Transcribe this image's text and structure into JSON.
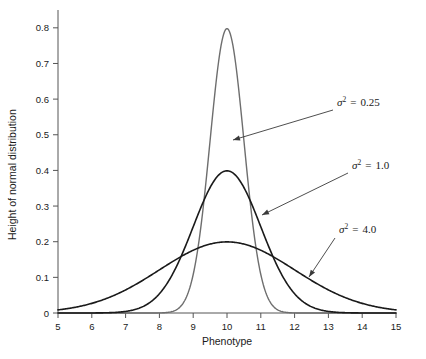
{
  "chart_data": {
    "type": "line",
    "title": "",
    "subtitle": "",
    "xlabel": "Phenotype",
    "ylabel": "Height of normal distribution",
    "xlim": [
      5,
      15
    ],
    "ylim": [
      0,
      0.85
    ],
    "grid": false,
    "legend_position": "inline-annotations",
    "x_ticks": [
      "5",
      "6",
      "7",
      "8",
      "9",
      "10",
      "11",
      "12",
      "13",
      "14",
      "15"
    ],
    "x_tick_values": [
      5,
      6,
      7,
      8,
      9,
      10,
      11,
      12,
      13,
      14,
      15
    ],
    "y_ticks": [
      "0",
      "0.1",
      "0.2",
      "0.3",
      "0.4",
      "0.5",
      "0.6",
      "0.7",
      "0.8"
    ],
    "y_tick_values": [
      0,
      0.1,
      0.2,
      0.3,
      0.4,
      0.5,
      0.6,
      0.7,
      0.8
    ],
    "series": [
      {
        "name": "σ² = 0.25",
        "mean": 10,
        "variance": 0.25,
        "peak": 0.798,
        "color": "#6e6e6e",
        "stroke_width": 1.4,
        "x": [
          5,
          5.5,
          6,
          6.5,
          7,
          7.5,
          8,
          8.25,
          8.5,
          8.75,
          9,
          9.25,
          9.5,
          9.75,
          10,
          10.25,
          10.5,
          10.75,
          11,
          11.25,
          11.5,
          11.75,
          12,
          12.5,
          13,
          13.5,
          14,
          14.5,
          15
        ],
        "values": [
          0,
          0,
          0,
          0,
          0,
          0.0001,
          0.0006,
          0.0022,
          0.0088,
          0.0295,
          0.0806,
          0.1798,
          0.3279,
          0.4891,
          0.7979,
          0.4891,
          0.3279,
          0.1798,
          0.0806,
          0.0295,
          0.0088,
          0.0022,
          0.0006,
          0.0001,
          0,
          0,
          0,
          0,
          0
        ]
      },
      {
        "name": "σ² = 1.0",
        "mean": 10,
        "variance": 1.0,
        "peak": 0.399,
        "color": "#1a1a1a",
        "stroke_width": 1.6,
        "x": [
          5,
          5.5,
          6,
          6.5,
          7,
          7.5,
          8,
          8.5,
          9,
          9.5,
          10,
          10.5,
          11,
          11.5,
          12,
          12.5,
          13,
          13.5,
          14,
          14.5,
          15
        ],
        "values": [
          0.0,
          0.0001,
          0.0001,
          0.0009,
          0.0044,
          0.0175,
          0.054,
          0.1295,
          0.242,
          0.3521,
          0.3989,
          0.3521,
          0.242,
          0.1295,
          0.054,
          0.0175,
          0.0044,
          0.0009,
          0.0001,
          0.0001,
          0.0
        ]
      },
      {
        "name": "σ² = 4.0",
        "mean": 10,
        "variance": 4.0,
        "peak": 0.199,
        "color": "#1a1a1a",
        "stroke_width": 1.6,
        "x": [
          5,
          5.5,
          6,
          6.5,
          7,
          7.5,
          8,
          8.5,
          9,
          9.5,
          10,
          10.5,
          11,
          11.5,
          12,
          12.5,
          13,
          13.5,
          14,
          14.5,
          15
        ],
        "values": [
          0.0088,
          0.0163,
          0.027,
          0.0404,
          0.054,
          0.0648,
          0.0704,
          0.0796,
          0.121,
          0.176,
          0.1995,
          0.176,
          0.121,
          0.0796,
          0.0704,
          0.0648,
          0.054,
          0.0404,
          0.027,
          0.0163,
          0.0088
        ]
      }
    ],
    "annotations": [
      {
        "id": "ann-var-025",
        "symbol": "σ",
        "exponent": "2",
        "equals": "=",
        "value": "0.25",
        "text": "σ² = 0.25",
        "label_x": 337,
        "label_y": 106,
        "leader_from_x": 333,
        "leader_from_y": 110,
        "leader_to_x": 233,
        "leader_to_y": 140
      },
      {
        "id": "ann-var-10",
        "symbol": "σ",
        "exponent": "2",
        "equals": "=",
        "value": "1.0",
        "text": "σ² = 1.0",
        "label_x": 352,
        "label_y": 169,
        "leader_from_x": 348,
        "leader_from_y": 173,
        "leader_to_x": 262,
        "leader_to_y": 215
      },
      {
        "id": "ann-var-40",
        "symbol": "σ",
        "exponent": "2",
        "equals": "=",
        "value": "4.0",
        "text": "σ² = 4.0",
        "label_x": 339,
        "label_y": 233,
        "leader_from_x": 335,
        "leader_from_y": 238,
        "leader_to_x": 309,
        "leader_to_y": 277
      }
    ]
  }
}
